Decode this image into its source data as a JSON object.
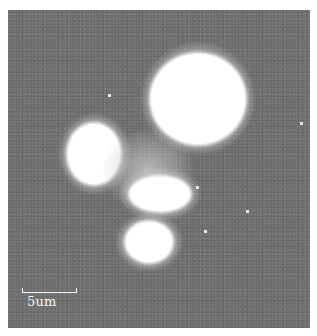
{
  "image": {
    "description": "Grayscale fluorescence micrograph showing several bright cell-like blobs on a noisy gray background",
    "background_color": "#6e6e6e",
    "foreground_color": "#ffffff"
  },
  "scale_bar": {
    "label": "5um"
  }
}
